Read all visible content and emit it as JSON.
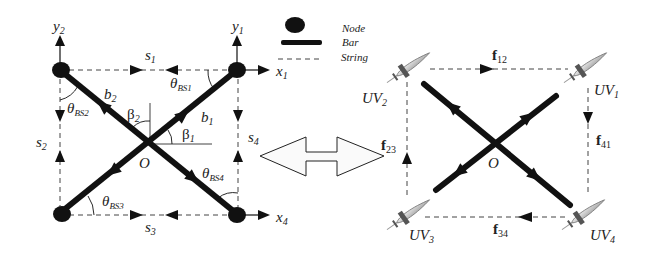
{
  "legend": {
    "items": [
      {
        "symbol": "node-dot",
        "label": "Node"
      },
      {
        "symbol": "bar-line",
        "label": "Bar"
      },
      {
        "symbol": "string-dash",
        "label": "String"
      }
    ]
  },
  "left_diagram": {
    "center_label": "O",
    "axes": {
      "y2": {
        "base": "y",
        "sub": "2"
      },
      "y1": {
        "base": "y",
        "sub": "1"
      },
      "x1": {
        "base": "x",
        "sub": "1"
      },
      "x4": {
        "base": "x",
        "sub": "4"
      }
    },
    "strings": {
      "s1": {
        "base": "s",
        "sub": "1"
      },
      "s2": {
        "base": "s",
        "sub": "2"
      },
      "s3": {
        "base": "s",
        "sub": "3"
      },
      "s4": {
        "base": "s",
        "sub": "4"
      }
    },
    "bars": {
      "b1": {
        "base": "b",
        "sub": "1"
      },
      "b2": {
        "base": "b",
        "sub": "2"
      }
    },
    "angles": {
      "beta1": {
        "base": "β",
        "sub": "1"
      },
      "beta2": {
        "base": "β",
        "sub": "2"
      },
      "theta_bs1": {
        "base": "θ",
        "sub": "BS1"
      },
      "theta_bs2": {
        "base": "θ",
        "sub": "BS2"
      },
      "theta_bs3": {
        "base": "θ",
        "sub": "BS3"
      },
      "theta_bs4": {
        "base": "θ",
        "sub": "BS4"
      }
    }
  },
  "right_diagram": {
    "center_label": "O",
    "vehicles": {
      "uv1": {
        "base": "UV",
        "sub": "1"
      },
      "uv2": {
        "base": "UV",
        "sub": "2"
      },
      "uv3": {
        "base": "UV",
        "sub": "3"
      },
      "uv4": {
        "base": "UV",
        "sub": "4"
      }
    },
    "forces": {
      "f12": {
        "base": "f",
        "sub": "12"
      },
      "f23": {
        "base": "f",
        "sub": "23"
      },
      "f34": {
        "base": "f",
        "sub": "34"
      },
      "f41": {
        "base": "f",
        "sub": "41"
      }
    }
  },
  "colors": {
    "ink": "#111111",
    "string": "#444444",
    "arrow_fill": "#ffffff",
    "uv_body": "#cfcfcf"
  }
}
